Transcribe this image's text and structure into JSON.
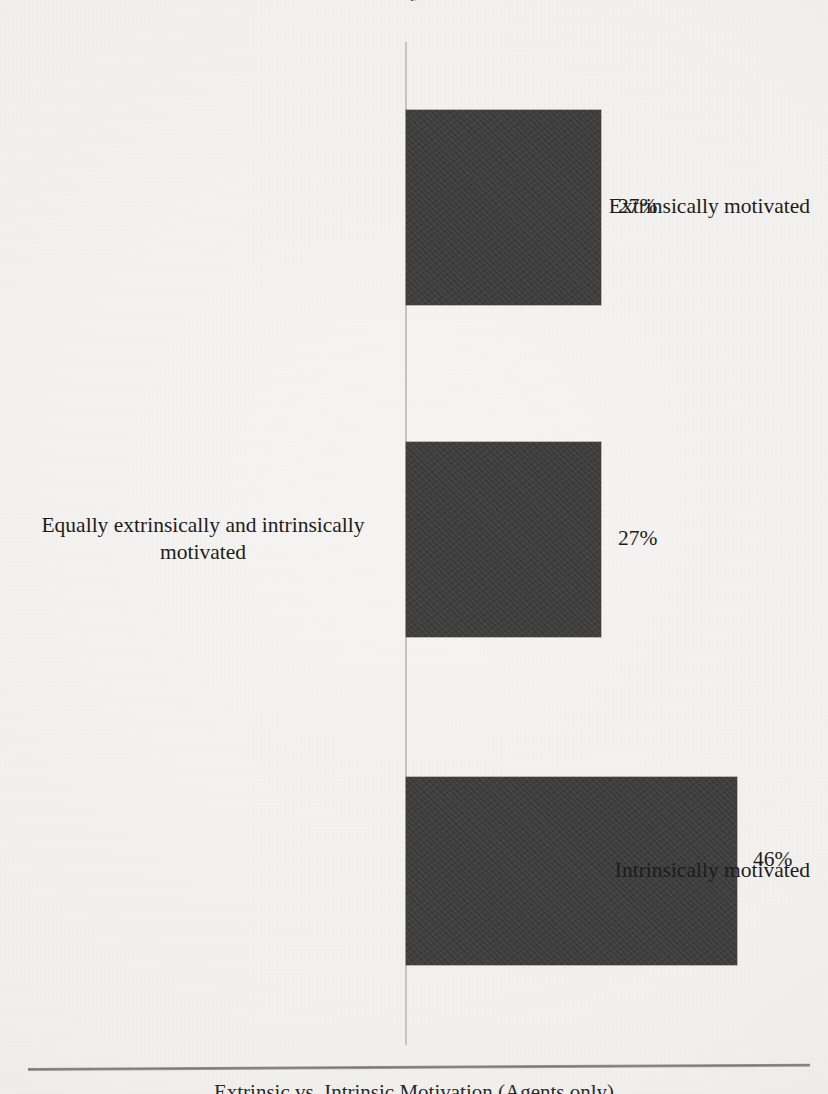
{
  "figure": {
    "title_sliver": "g",
    "caption": "Extrinsic vs. Intrinsic Motivation (Agents only)",
    "bar_color": "#3b3b3b",
    "axis_color": "#c9c6c2",
    "background_color": "#f5f4f2"
  },
  "chart_data": {
    "type": "bar",
    "orientation": "horizontal",
    "title": "Extrinsic vs. Intrinsic Motivation (Agents only)",
    "xlabel": "",
    "ylabel": "",
    "xlim": [
      0,
      59
    ],
    "grid": false,
    "legend": false,
    "categories": [
      "Extrinsically motivated",
      "Equally extrinsically and intrinsically motivated",
      "Intrinsically motivated"
    ],
    "values": [
      27,
      27,
      46
    ],
    "value_labels": [
      "27%",
      "27%",
      "46%"
    ],
    "units": "percent"
  },
  "bars": [
    {
      "label": "Extrinsically motivated",
      "label_lines": [
        "Extrinsically motivated"
      ],
      "value": 27,
      "value_label": "27%",
      "top": 110,
      "height": 195,
      "width": 195,
      "label_top": 193,
      "value_left": 618,
      "value_top": 194
    },
    {
      "label": "Equally extrinsically and intrinsically motivated",
      "label_lines": [
        "Equally extrinsically and intrinsically",
        "motivated"
      ],
      "value": 27,
      "value_label": "27%",
      "top": 442,
      "height": 195,
      "width": 195,
      "label_top": 512,
      "value_left": 618,
      "value_top": 526
    },
    {
      "label": "Intrinsically motivated",
      "label_lines": [
        "Intrinsically motivated"
      ],
      "value": 46,
      "value_label": "46%",
      "top": 777,
      "height": 188,
      "width": 331,
      "label_top": 857,
      "value_left": 753,
      "value_top": 847
    }
  ]
}
